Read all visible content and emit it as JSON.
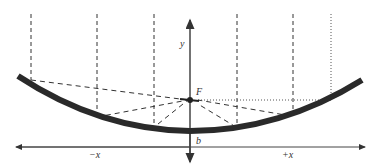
{
  "diagram": {
    "labels": {
      "y_axis": "y",
      "focus": "F",
      "vertex": "b",
      "neg_x": "−x",
      "pos_x": "+x"
    },
    "colors": {
      "curve": "#2a2a2a",
      "axis": "#444444",
      "ray": "#333333"
    }
  }
}
